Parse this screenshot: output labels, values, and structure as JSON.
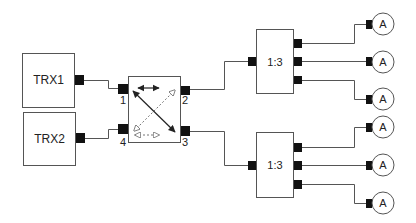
{
  "diagram": {
    "type": "rf-distribution-schematic",
    "transceivers": [
      {
        "id": "trx1",
        "label": "TRX1"
      },
      {
        "id": "trx2",
        "label": "TRX2"
      }
    ],
    "coupler": {
      "label": "",
      "ports": [
        {
          "id": "p1",
          "label": "1"
        },
        {
          "id": "p2",
          "label": "2"
        },
        {
          "id": "p3",
          "label": "3"
        },
        {
          "id": "p4",
          "label": "4"
        }
      ],
      "paths": [
        {
          "from": "1",
          "to": "2",
          "style": "solid-double-arrow-horizontal"
        },
        {
          "from": "1",
          "to": "3",
          "style": "solid-double-arrow-diagonal"
        },
        {
          "from": "4",
          "to": "2",
          "style": "dashed-hollow-arrow-diagonal"
        },
        {
          "from": "4",
          "to": "3",
          "style": "dashed-hollow-arrow-horizontal"
        }
      ]
    },
    "splitters": [
      {
        "id": "splitter-upper",
        "label": "1:3"
      },
      {
        "id": "splitter-lower",
        "label": "1:3"
      }
    ],
    "antennas": [
      {
        "id": "ant1",
        "label": "A"
      },
      {
        "id": "ant2",
        "label": "A"
      },
      {
        "id": "ant3",
        "label": "A"
      },
      {
        "id": "ant4",
        "label": "A"
      },
      {
        "id": "ant5",
        "label": "A"
      },
      {
        "id": "ant6",
        "label": "A"
      }
    ],
    "connections": [
      {
        "from": "TRX1",
        "to": "coupler port 1"
      },
      {
        "from": "TRX2",
        "to": "coupler port 4"
      },
      {
        "from": "coupler port 2",
        "to": "upper 1:3 splitter"
      },
      {
        "from": "coupler port 3",
        "to": "lower 1:3 splitter"
      },
      {
        "from": "upper 1:3 splitter",
        "to": "antennas 1-3"
      },
      {
        "from": "lower 1:3 splitter",
        "to": "antennas 4-6"
      }
    ],
    "colors": {
      "line": "#555555",
      "port": "#111111",
      "background": "#ffffff"
    }
  }
}
